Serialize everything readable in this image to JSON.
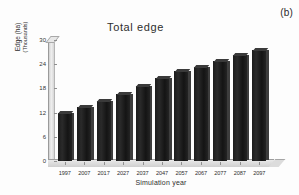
{
  "panel": {
    "letter": "(b)"
  },
  "chart_data": {
    "type": "bar",
    "title": "Total edge",
    "xlabel": "Simulation year",
    "ylabel": "Edge (ha)",
    "ylabel_sub": "(Thousands)",
    "categories": [
      "1997",
      "2007",
      "2017",
      "2027",
      "2037",
      "2047",
      "2057",
      "2067",
      "2077",
      "2087",
      "2097"
    ],
    "values": [
      12.0,
      13.4,
      14.9,
      16.6,
      18.6,
      20.6,
      22.2,
      23.2,
      24.7,
      26.2,
      27.5
    ],
    "ylim": [
      0,
      30
    ],
    "yticks": [
      0,
      6,
      12,
      18,
      24,
      30
    ],
    "grid": false,
    "legend": null,
    "bar_color": "#1c1c1c",
    "series": [
      {
        "name": "Total edge",
        "values": [
          12.0,
          13.4,
          14.9,
          16.6,
          18.6,
          20.6,
          22.2,
          23.2,
          24.7,
          26.2,
          27.5
        ]
      }
    ]
  }
}
